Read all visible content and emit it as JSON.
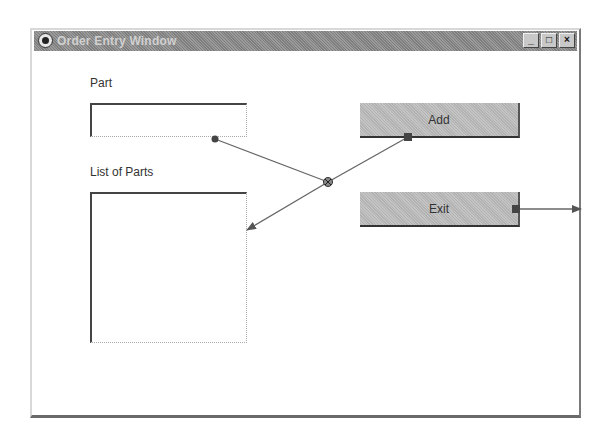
{
  "window": {
    "title": "Order Entry Window",
    "controls": {
      "minimize": "_",
      "maximize": "□",
      "close": "×"
    }
  },
  "form": {
    "part_label": "Part",
    "part_value": "",
    "list_label": "List of Parts",
    "list_items": [],
    "add_button": "Add",
    "exit_button": "Exit"
  },
  "connections": [
    {
      "from": "part-textbox",
      "to": "junction",
      "type": "data"
    },
    {
      "from": "add-button",
      "to": "junction",
      "type": "event"
    },
    {
      "from": "junction",
      "to": "parts-listbox",
      "type": "action"
    },
    {
      "from": "exit-button",
      "to": "window-edge",
      "type": "event"
    }
  ],
  "colors": {
    "connector_line": "#666666",
    "button_face": "#bdbdbd",
    "title_bar": "#8c8c8c"
  }
}
